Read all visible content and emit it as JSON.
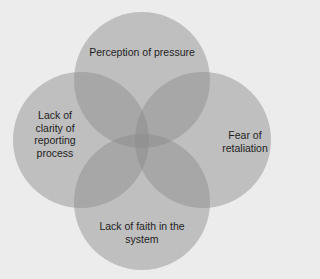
{
  "diagram": {
    "type": "venn",
    "colors": {
      "background": "#ececec",
      "circle_fill": "#8a8a8a",
      "text": "#1e1e1e"
    },
    "sets": [
      {
        "id": "top",
        "label": "Perception of pressure"
      },
      {
        "id": "left",
        "label": "Lack of\nclarity of\nreporting\nprocess"
      },
      {
        "id": "right",
        "label": "Fear of\nretaliation"
      },
      {
        "id": "bottom",
        "label": "Lack of faith in the\nsystem"
      }
    ]
  }
}
